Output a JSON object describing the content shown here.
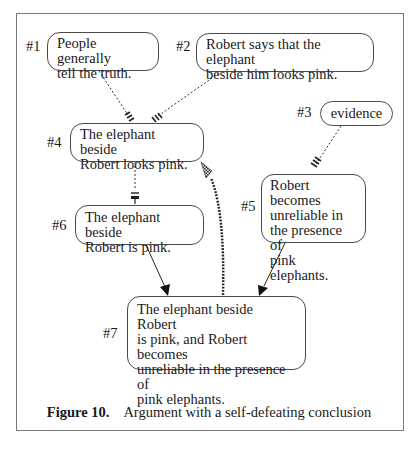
{
  "figure": {
    "caption_label": "Figure 10.",
    "caption_text": "Argument with a self-defeating conclusion"
  },
  "nodes": [
    {
      "id": "#1",
      "label": "#1",
      "text": "People generally\ntell the truth."
    },
    {
      "id": "#2",
      "label": "#2",
      "text": "Robert says that the elephant\nbeside him looks pink."
    },
    {
      "id": "#3",
      "label": "#3",
      "text": "evidence"
    },
    {
      "id": "#4",
      "label": "#4",
      "text": "The elephant beside\nRobert looks pink."
    },
    {
      "id": "#5",
      "label": "#5",
      "text": "Robert becomes\nunreliable in\nthe presence of\npink elephants."
    },
    {
      "id": "#6",
      "label": "#6",
      "text": "The elephant beside\nRobert is pink."
    },
    {
      "id": "#7",
      "label": "#7",
      "text": "The elephant beside Robert\nis pink, and Robert becomes\nunreliable in the presence of\npink elephants."
    }
  ],
  "edges": [
    {
      "from": "#1",
      "to": "#4",
      "style": "dotted",
      "marker": "hatched"
    },
    {
      "from": "#2",
      "to": "#4",
      "style": "dotted",
      "marker": "hatched"
    },
    {
      "from": "#3",
      "to": "#5",
      "style": "dotted",
      "marker": "hatched"
    },
    {
      "from": "#4",
      "to": "#6",
      "style": "dotted",
      "marker": "bar"
    },
    {
      "from": "#6",
      "to": "#7",
      "style": "solid",
      "marker": "arrow"
    },
    {
      "from": "#5",
      "to": "#7",
      "style": "solid",
      "marker": "arrow"
    },
    {
      "from": "#7",
      "to": "#4",
      "style": "thick-dotted",
      "marker": "checkered-arrow"
    }
  ]
}
